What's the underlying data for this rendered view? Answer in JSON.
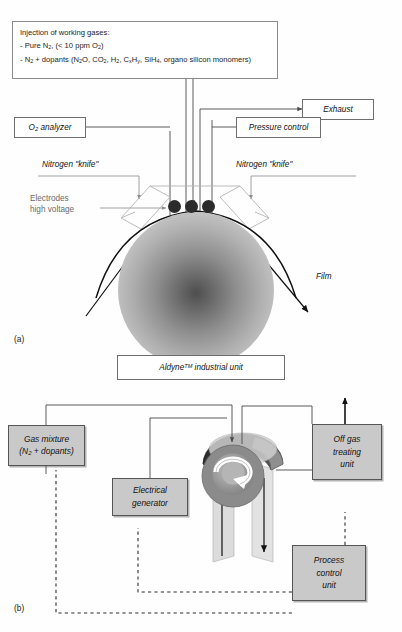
{
  "figure": {
    "panel_a_tag": "(a)",
    "panel_b_tag": "(b)"
  },
  "panel_a": {
    "injection_box": {
      "title": "Injection of working gases:",
      "line1_pre": "- Pure N",
      "line1_sub1": "2",
      "line1_mid": ", (< 10 ppm O",
      "line1_sub2": "2",
      "line1_end": ")",
      "line2_parts": [
        "- N",
        "2",
        " + dopants (N",
        "2",
        "O, CO",
        "2",
        ", H",
        "2",
        ", C",
        "x",
        "H",
        "y",
        ", SiH",
        "4",
        ", organo silicon monomers)"
      ]
    },
    "exhaust_label": "Exhaust",
    "o2_analyzer": {
      "pre": "O",
      "sub": "2",
      "post": " analyzer"
    },
    "pressure_control_label": "Pressure control",
    "nitrogen_knife_left": "Nitrogen \"knife\"",
    "nitrogen_knife_right": "Nitrogen \"knife\"",
    "electrodes_label_line1": "Electrodes",
    "electrodes_label_line2": "high voltage",
    "film_label": "Film",
    "electrode_count": 3
  },
  "panel_b": {
    "title_box": {
      "name": "Aldyne",
      "tm": "TM",
      "suffix": " industrial unit"
    },
    "gas_mixture_box": {
      "line1": "Gas mixture",
      "line2_pre": "(N",
      "line2_sub": "2",
      "line2_post": " + dopants)"
    },
    "electrical_generator_box": {
      "line1": "Electrical",
      "line2": "generator"
    },
    "off_gas_box": {
      "line1": "Off gas",
      "line2": "treating",
      "line3": "unit"
    },
    "process_control_box": {
      "line1": "Process",
      "line2": "control",
      "line3": "unit"
    }
  },
  "colors": {
    "box_fill": "#c9c9c9",
    "box_stroke": "#555555",
    "line": "#4a4a4a",
    "gray_text": "#6a6a6a",
    "hood_dark": "#3a3a3a",
    "duct_light": "#d9d9d9",
    "roller_mid": "#9a9a9a"
  }
}
